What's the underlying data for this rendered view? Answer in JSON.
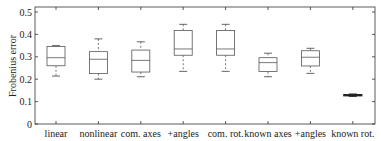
{
  "chart_data": {
    "type": "box",
    "title": "",
    "xlabel": "",
    "ylabel": "Frobenius error",
    "ylim": [
      0,
      0.52
    ],
    "yticks": [
      0,
      0.1,
      0.2,
      0.3,
      0.4,
      0.5
    ],
    "ytick_labels": [
      "0",
      "0.1",
      "0.2",
      "0.3",
      "0.4",
      "0.5"
    ],
    "grid": false,
    "legend": null,
    "categories": [
      "linear",
      "nonlinear",
      "com. axes",
      "+angles",
      "com. rot.",
      "known axes",
      "+angles",
      "known rot."
    ],
    "boxes": [
      {
        "label": "linear",
        "whisker_low": 0.214,
        "q1": 0.26,
        "median": 0.296,
        "q3": 0.346,
        "whisker_high": 0.35
      },
      {
        "label": "nonlinear",
        "whisker_low": 0.2,
        "q1": 0.225,
        "median": 0.289,
        "q3": 0.323,
        "whisker_high": 0.38
      },
      {
        "label": "com. axes",
        "whisker_low": 0.211,
        "q1": 0.232,
        "median": 0.284,
        "q3": 0.33,
        "whisker_high": 0.367
      },
      {
        "label": "+angles",
        "whisker_low": 0.235,
        "q1": 0.307,
        "median": 0.335,
        "q3": 0.417,
        "whisker_high": 0.445
      },
      {
        "label": "com. rot.",
        "whisker_low": 0.235,
        "q1": 0.307,
        "median": 0.335,
        "q3": 0.417,
        "whisker_high": 0.445
      },
      {
        "label": "known axes",
        "whisker_low": 0.211,
        "q1": 0.234,
        "median": 0.274,
        "q3": 0.296,
        "whisker_high": 0.316
      },
      {
        "label": "+angles",
        "whisker_low": 0.226,
        "q1": 0.259,
        "median": 0.298,
        "q3": 0.327,
        "whisker_high": 0.338
      },
      {
        "label": "known rot.",
        "whisker_low": 0.123,
        "q1": 0.126,
        "median": 0.128,
        "q3": 0.131,
        "whisker_high": 0.134
      }
    ]
  },
  "colors": {
    "axis": "#333333",
    "box": "#555555",
    "known_rot_box": "#222222"
  }
}
